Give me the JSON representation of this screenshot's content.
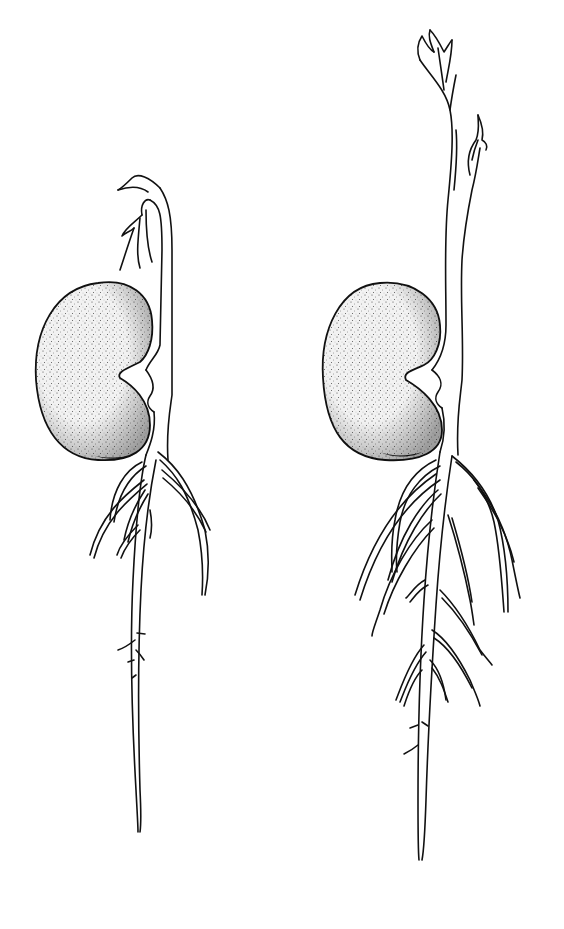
{
  "illustration": {
    "subject": "Two germinating bean seedlings (line drawing)",
    "style": "black ink line art with stippled seed shading",
    "colors": {
      "ink": "#111111",
      "background": "#ffffff"
    },
    "figures": [
      {
        "id": "seedling-left",
        "stage": "early",
        "shoot": "hooked epicotyl with unfolding leaves",
        "roots": "primary root with few laterals"
      },
      {
        "id": "seedling-right",
        "stage": "later",
        "shoot": "upright elongated shoot with leaf buds",
        "roots": "primary root with many laterals"
      }
    ]
  }
}
